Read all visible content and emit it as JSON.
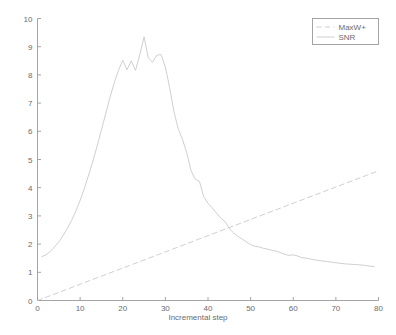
{
  "chart_data": {
    "type": "line",
    "title": "",
    "xlabel": "Incremental step",
    "ylabel": "",
    "xlim": [
      0,
      80
    ],
    "ylim": [
      0,
      10
    ],
    "xticks": [
      0,
      10,
      20,
      30,
      40,
      50,
      60,
      70,
      80
    ],
    "yticks": [
      0,
      1,
      2,
      3,
      4,
      5,
      6,
      7,
      8,
      9,
      10
    ],
    "xticklabels": [
      "0",
      "10",
      "20",
      "30",
      "40",
      "50",
      "60",
      "70",
      "80"
    ],
    "yticklabels": [
      "0",
      "1",
      "2",
      "3",
      "4",
      "5",
      "6",
      "7",
      "8",
      "9",
      "10"
    ],
    "grid": false,
    "legend_position": "upper right",
    "line_color": "#c9c9c9",
    "axis_color": "#9a9a9a",
    "text_color": "#6b6b6b",
    "series": [
      {
        "name": "MaxW+",
        "style": "dashed",
        "x": [
          0,
          80
        ],
        "values": [
          0.0,
          4.6
        ]
      },
      {
        "name": "SNR",
        "style": "solid",
        "x": [
          1,
          2,
          3,
          4,
          5,
          6,
          7,
          8,
          9,
          10,
          11,
          12,
          13,
          14,
          15,
          16,
          17,
          18,
          19,
          20,
          21,
          22,
          23,
          24,
          25,
          26,
          27,
          28,
          29,
          30,
          31,
          32,
          33,
          34,
          35,
          36,
          37,
          38,
          39,
          40,
          41,
          42,
          43,
          44,
          45,
          46,
          47,
          48,
          49,
          50,
          51,
          52,
          53,
          54,
          55,
          56,
          57,
          58,
          59,
          60,
          61,
          62,
          63,
          64,
          65,
          66,
          67,
          68,
          69,
          70,
          71,
          72,
          73,
          74,
          75,
          76,
          77,
          78,
          79
        ],
        "values": [
          1.55,
          1.62,
          1.74,
          1.9,
          2.08,
          2.3,
          2.55,
          2.84,
          3.17,
          3.55,
          3.98,
          4.45,
          4.95,
          5.48,
          6.05,
          6.62,
          7.2,
          7.72,
          8.16,
          8.52,
          8.18,
          8.5,
          8.16,
          8.72,
          9.35,
          8.6,
          8.45,
          8.7,
          8.72,
          8.28,
          7.55,
          6.7,
          6.1,
          5.72,
          5.25,
          4.62,
          4.3,
          4.22,
          3.68,
          3.45,
          3.28,
          3.1,
          2.92,
          2.8,
          2.55,
          2.4,
          2.28,
          2.18,
          2.08,
          1.98,
          1.92,
          1.9,
          1.85,
          1.82,
          1.78,
          1.75,
          1.7,
          1.64,
          1.6,
          1.62,
          1.58,
          1.52,
          1.5,
          1.47,
          1.44,
          1.42,
          1.4,
          1.38,
          1.36,
          1.34,
          1.32,
          1.3,
          1.29,
          1.28,
          1.27,
          1.26,
          1.24,
          1.22,
          1.2
        ]
      }
    ],
    "legend": [
      {
        "label": "MaxW+",
        "style": "dashed"
      },
      {
        "label": "SNR",
        "style": "solid"
      }
    ]
  }
}
